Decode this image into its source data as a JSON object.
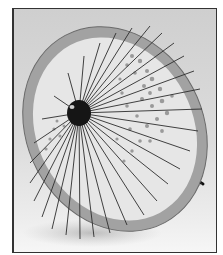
{
  "image": {
    "subject": "Japanese paper umbrella (wagasa) with leaf pattern, tilted open on its side",
    "colors": {
      "background": "#d6d6d6",
      "canopy": "#e4e4e4",
      "rim_band": "#9a9a9a",
      "ribs": "#2a2a2a",
      "hub": "#111111",
      "pattern": "#7a7a7a",
      "frame_border": "#333333"
    }
  }
}
